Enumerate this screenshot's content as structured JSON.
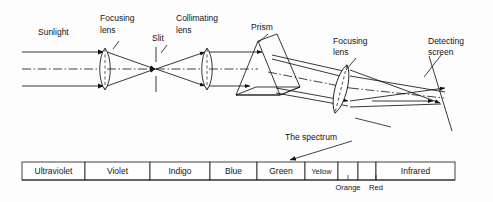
{
  "diagram": {
    "background_color": "#fdfdfd",
    "ink_color": "#141414",
    "labels": {
      "sunlight": "Sunlight",
      "focusing_lens_1_line1": "Focusing",
      "focusing_lens_1_line2": "lens",
      "slit": "Slit",
      "collimating_lens_line1": "Collimating",
      "collimating_lens_line2": "lens",
      "prism": "Prism",
      "focusing_lens_2_line1": "Focusing",
      "focusing_lens_2_line2": "lens",
      "detecting_screen_line1": "Detecting",
      "detecting_screen_line2": "screen",
      "the_spectrum": "The spectrum"
    }
  },
  "spectrum_bar": {
    "cells": [
      {
        "label": "Ultraviolet",
        "x": 22,
        "width": 63,
        "label_style": "normal"
      },
      {
        "label": "Violet",
        "x": 85,
        "width": 65,
        "label_style": "normal"
      },
      {
        "label": "Indigo",
        "x": 150,
        "width": 60,
        "label_style": "normal"
      },
      {
        "label": "Blue",
        "x": 210,
        "width": 47,
        "label_style": "normal"
      },
      {
        "label": "Green",
        "x": 257,
        "width": 48,
        "label_style": "normal"
      },
      {
        "label": "Yellow",
        "x": 305,
        "width": 33,
        "label_style": "small"
      },
      {
        "label": "",
        "x": 338,
        "width": 20,
        "label_style": "normal"
      },
      {
        "label": "",
        "x": 358,
        "width": 18,
        "label_style": "normal"
      },
      {
        "label": "Infrared",
        "x": 376,
        "width": 79,
        "label_style": "normal"
      }
    ],
    "under_labels": [
      {
        "text": "Orange",
        "x": 348
      },
      {
        "text": "Red",
        "x": 376
      }
    ],
    "top_y": 162,
    "bottom_y": 180
  }
}
